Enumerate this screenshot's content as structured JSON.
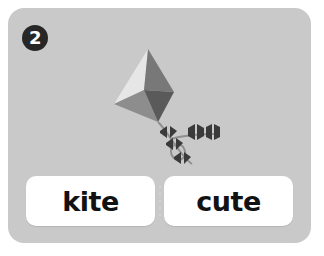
{
  "card": {
    "background_color": "#c9c9c9",
    "page_background_color": "#ffffff"
  },
  "question": {
    "number": "2",
    "badge_background_color": "#272727",
    "badge_text_color": "#ffffff"
  },
  "illustration": {
    "name": "kite-illustration",
    "subject": "kite",
    "parts": [
      {
        "name": "kite-panel-top-left",
        "color": "#e6e6e6"
      },
      {
        "name": "kite-panel-top-right",
        "color": "#787878"
      },
      {
        "name": "kite-panel-bottom-left",
        "color": "#8d8d8d"
      },
      {
        "name": "kite-panel-bottom-right",
        "color": "#5a5a5a"
      },
      {
        "name": "kite-tail-string",
        "color": "#8f8f8f"
      },
      {
        "name": "kite-tail-bow",
        "color": "#3a3a3a"
      }
    ]
  },
  "answers": {
    "choices": [
      {
        "label": "kite",
        "name": "answer-choice-kite"
      },
      {
        "label": "cute",
        "name": "answer-choice-cute"
      }
    ],
    "button_background_color": "#ffffff",
    "label_color": "#121212",
    "divider_dot_color": "#d6d6d6"
  }
}
